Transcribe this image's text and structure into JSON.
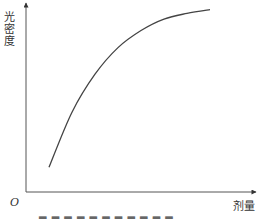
{
  "chart_data": {
    "type": "line",
    "title": "",
    "xlabel": "剂量",
    "ylabel": "光密度",
    "origin_label": "O",
    "grid": false,
    "legend": null,
    "ticks": {
      "x": [],
      "y": []
    },
    "series": [
      {
        "name": "剂量-光密度曲线",
        "description": "saturating curve rising steeply then leveling off",
        "x": [
          0.1,
          0.2,
          0.3,
          0.4,
          0.5,
          0.6,
          0.7,
          0.8
        ],
        "y": [
          0.13,
          0.42,
          0.62,
          0.76,
          0.85,
          0.91,
          0.94,
          0.96
        ]
      }
    ],
    "xlim": [
      0,
      1
    ],
    "ylim": [
      0,
      1
    ],
    "caption": "图 (caption cropped at bottom edge)"
  },
  "labels": {
    "ylabel": "光密度",
    "xlabel": "剂量",
    "origin": "O"
  }
}
